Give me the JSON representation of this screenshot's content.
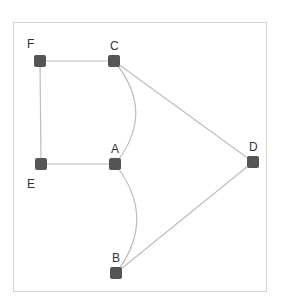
{
  "diagram": {
    "type": "graph",
    "frame": {
      "x": 13,
      "y": 22,
      "width": 253,
      "height": 269,
      "stroke": "#d4d4d4"
    },
    "node_color": "#555555",
    "edge_color": "#bdbdbd",
    "nodes": [
      {
        "id": "A",
        "label": "A",
        "x": 115,
        "y": 164,
        "label_x": 111,
        "label_y": 153
      },
      {
        "id": "B",
        "label": "B",
        "x": 116,
        "y": 273,
        "label_x": 112,
        "label_y": 262
      },
      {
        "id": "C",
        "label": "C",
        "x": 114,
        "y": 61,
        "label_x": 110,
        "label_y": 50
      },
      {
        "id": "D",
        "label": "D",
        "x": 253,
        "y": 162,
        "label_x": 249,
        "label_y": 151
      },
      {
        "id": "E",
        "label": "E",
        "x": 41,
        "y": 164,
        "label_x": 27,
        "label_y": 188
      },
      {
        "id": "F",
        "label": "F",
        "x": 40,
        "y": 61,
        "label_x": 27,
        "label_y": 48
      }
    ],
    "edges": [
      {
        "from": "F",
        "to": "C",
        "style": "straight"
      },
      {
        "from": "F",
        "to": "E",
        "style": "straight"
      },
      {
        "from": "E",
        "to": "A",
        "style": "straight"
      },
      {
        "from": "C",
        "to": "D",
        "style": "straight"
      },
      {
        "from": "B",
        "to": "D",
        "style": "straight"
      },
      {
        "from": "C",
        "to": "A",
        "style": "curved"
      },
      {
        "from": "A",
        "to": "B",
        "style": "curved"
      }
    ]
  }
}
